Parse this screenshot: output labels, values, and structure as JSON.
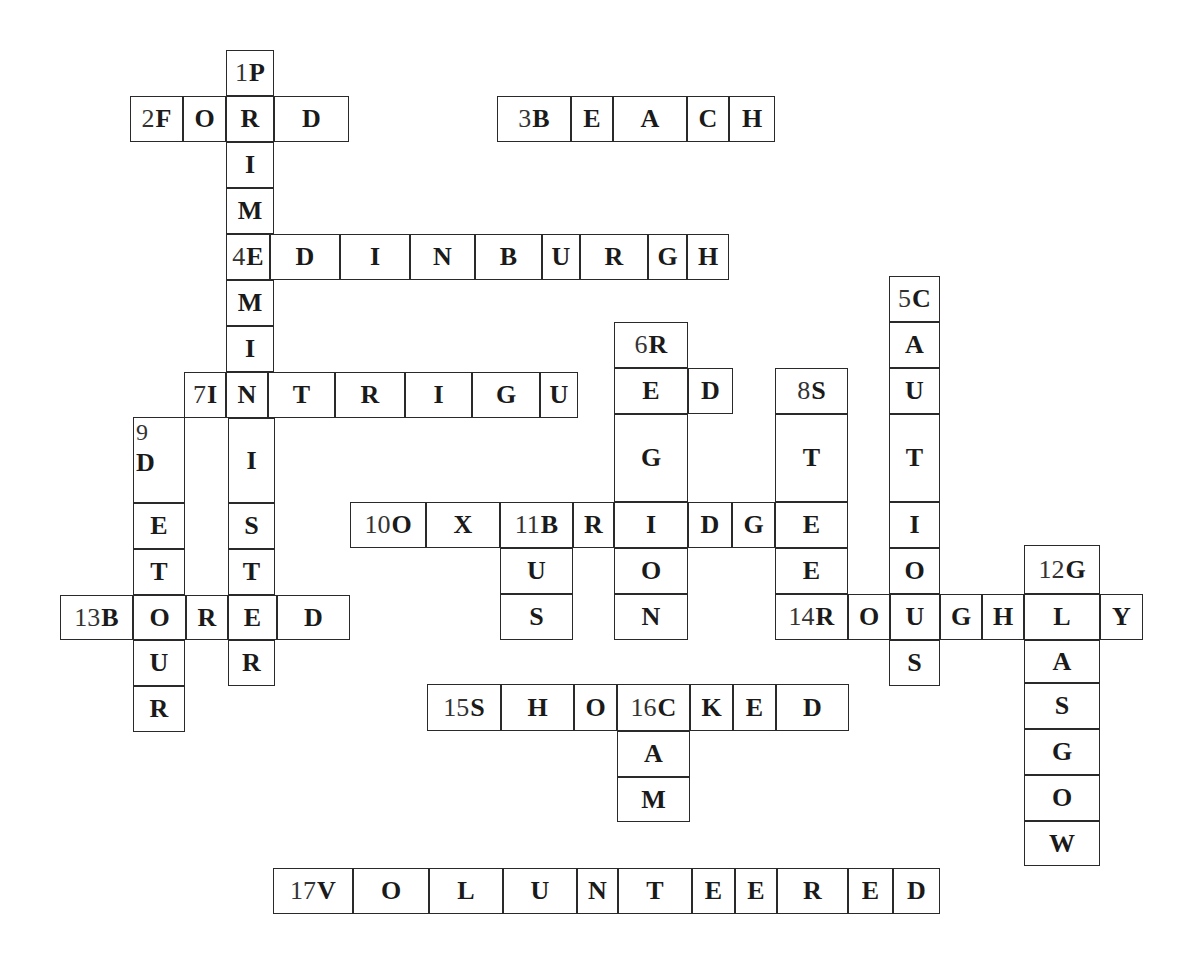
{
  "words": [
    {
      "number": "1",
      "direction": "down",
      "answer": "PRIMEMINISTER"
    },
    {
      "number": "2",
      "direction": "across",
      "answer": "FORD"
    },
    {
      "number": "3",
      "direction": "across",
      "answer": "BEACH"
    },
    {
      "number": "4",
      "direction": "across",
      "answer": "EDINBURGH"
    },
    {
      "number": "5",
      "direction": "down",
      "answer": "CAUTIOUS"
    },
    {
      "number": "6",
      "direction": "down",
      "answer": "REGION"
    },
    {
      "number": "7",
      "direction": "across",
      "answer": "INTRIGUED"
    },
    {
      "number": "8",
      "direction": "down",
      "answer": "STEEP"
    },
    {
      "number": "9",
      "direction": "down",
      "answer": "DETOUR"
    },
    {
      "number": "10",
      "direction": "across",
      "answer": "OXBRIDGE"
    },
    {
      "number": "11",
      "direction": "down",
      "answer": "BUS"
    },
    {
      "number": "12",
      "direction": "down",
      "answer": "GLASGOW"
    },
    {
      "number": "13",
      "direction": "across",
      "answer": "BORED"
    },
    {
      "number": "14",
      "direction": "across",
      "answer": "ROUGHLY"
    },
    {
      "number": "15",
      "direction": "across",
      "answer": "SHOCKED"
    },
    {
      "number": "16",
      "direction": "down",
      "answer": "CAM"
    },
    {
      "number": "17",
      "direction": "across",
      "answer": "VOLUNTEERED"
    }
  ],
  "cells": [
    {
      "x": 226,
      "y": 50,
      "w": 48,
      "h": 46,
      "num": "1",
      "l": "P"
    },
    {
      "x": 130,
      "y": 96,
      "w": 53,
      "h": 46,
      "num": "2",
      "l": "F"
    },
    {
      "x": 183,
      "y": 96,
      "w": 43,
      "h": 46,
      "l": "O"
    },
    {
      "x": 226,
      "y": 96,
      "w": 48,
      "h": 46,
      "l": "R"
    },
    {
      "x": 274,
      "y": 96,
      "w": 75,
      "h": 46,
      "l": "D"
    },
    {
      "x": 497,
      "y": 96,
      "w": 74,
      "h": 46,
      "num": "3",
      "l": "B"
    },
    {
      "x": 571,
      "y": 96,
      "w": 42,
      "h": 46,
      "l": "E"
    },
    {
      "x": 613,
      "y": 96,
      "w": 74,
      "h": 46,
      "l": "A"
    },
    {
      "x": 687,
      "y": 96,
      "w": 42,
      "h": 46,
      "l": "C"
    },
    {
      "x": 729,
      "y": 96,
      "w": 46,
      "h": 46,
      "l": "H"
    },
    {
      "x": 226,
      "y": 142,
      "w": 48,
      "h": 46,
      "l": "I"
    },
    {
      "x": 226,
      "y": 188,
      "w": 48,
      "h": 46,
      "l": "M"
    },
    {
      "x": 226,
      "y": 234,
      "w": 44,
      "h": 46,
      "num": "4",
      "l": "E"
    },
    {
      "x": 270,
      "y": 234,
      "w": 70,
      "h": 46,
      "l": "D"
    },
    {
      "x": 340,
      "y": 234,
      "w": 70,
      "h": 46,
      "l": "I"
    },
    {
      "x": 410,
      "y": 234,
      "w": 65,
      "h": 46,
      "l": "N"
    },
    {
      "x": 475,
      "y": 234,
      "w": 67,
      "h": 46,
      "l": "B"
    },
    {
      "x": 542,
      "y": 234,
      "w": 38,
      "h": 46,
      "l": "U"
    },
    {
      "x": 580,
      "y": 234,
      "w": 68,
      "h": 46,
      "l": "R"
    },
    {
      "x": 648,
      "y": 234,
      "w": 39,
      "h": 46,
      "l": "G"
    },
    {
      "x": 687,
      "y": 234,
      "w": 42,
      "h": 46,
      "l": "H"
    },
    {
      "x": 226,
      "y": 280,
      "w": 48,
      "h": 46,
      "l": "M"
    },
    {
      "x": 889,
      "y": 276,
      "w": 51,
      "h": 46,
      "num": "5",
      "l": "C"
    },
    {
      "x": 226,
      "y": 326,
      "w": 48,
      "h": 46,
      "l": "I"
    },
    {
      "x": 614,
      "y": 322,
      "w": 74,
      "h": 46,
      "num": "6",
      "l": "R"
    },
    {
      "x": 889,
      "y": 322,
      "w": 51,
      "h": 46,
      "l": "A"
    },
    {
      "x": 184,
      "y": 372,
      "w": 42,
      "h": 46,
      "num": "7",
      "l": "I"
    },
    {
      "x": 226,
      "y": 372,
      "w": 42,
      "h": 46,
      "l": "N"
    },
    {
      "x": 268,
      "y": 372,
      "w": 67,
      "h": 46,
      "l": "T"
    },
    {
      "x": 335,
      "y": 372,
      "w": 70,
      "h": 46,
      "l": "R"
    },
    {
      "x": 405,
      "y": 372,
      "w": 67,
      "h": 46,
      "l": "I"
    },
    {
      "x": 472,
      "y": 372,
      "w": 68,
      "h": 46,
      "l": "G"
    },
    {
      "x": 540,
      "y": 372,
      "w": 38,
      "h": 46,
      "l": "U"
    },
    {
      "x": 578,
      "y": 368,
      "w": 110,
      "h": 0,
      "l": ""
    },
    {
      "x": 614,
      "y": 368,
      "w": 74,
      "h": 46,
      "l": "E"
    },
    {
      "x": 688,
      "y": 368,
      "w": 45,
      "h": 46,
      "l": "D"
    },
    {
      "x": 775,
      "y": 368,
      "w": 73,
      "h": 46,
      "num": "8",
      "l": "S"
    },
    {
      "x": 889,
      "y": 368,
      "w": 51,
      "h": 46,
      "l": "U"
    },
    {
      "x": 133,
      "y": 417,
      "w": 52,
      "h": 86,
      "num": "9",
      "l": "D",
      "tall": true
    },
    {
      "x": 228,
      "y": 418,
      "w": 47,
      "h": 85,
      "l": "I"
    },
    {
      "x": 614,
      "y": 414,
      "w": 74,
      "h": 88,
      "l": "G"
    },
    {
      "x": 775,
      "y": 414,
      "w": 73,
      "h": 88,
      "l": "T"
    },
    {
      "x": 889,
      "y": 414,
      "w": 51,
      "h": 88,
      "l": "T"
    },
    {
      "x": 133,
      "y": 503,
      "w": 52,
      "h": 46,
      "l": "E"
    },
    {
      "x": 228,
      "y": 503,
      "w": 47,
      "h": 46,
      "l": "S"
    },
    {
      "x": 350,
      "y": 502,
      "w": 76,
      "h": 46,
      "num": "10",
      "l": "O"
    },
    {
      "x": 426,
      "y": 502,
      "w": 74,
      "h": 46,
      "l": "X"
    },
    {
      "x": 500,
      "y": 502,
      "w": 73,
      "h": 46,
      "num": "11",
      "l": "B"
    },
    {
      "x": 573,
      "y": 502,
      "w": 41,
      "h": 46,
      "l": "R"
    },
    {
      "x": 614,
      "y": 502,
      "w": 74,
      "h": 46,
      "l": "I"
    },
    {
      "x": 688,
      "y": 502,
      "w": 44,
      "h": 46,
      "l": "D"
    },
    {
      "x": 732,
      "y": 502,
      "w": 43,
      "h": 46,
      "l": "G"
    },
    {
      "x": 775,
      "y": 502,
      "w": 73,
      "h": 46,
      "l": "E"
    },
    {
      "x": 889,
      "y": 502,
      "w": 51,
      "h": 46,
      "l": "I"
    },
    {
      "x": 133,
      "y": 549,
      "w": 52,
      "h": 46,
      "l": "T"
    },
    {
      "x": 228,
      "y": 549,
      "w": 47,
      "h": 46,
      "l": "T"
    },
    {
      "x": 500,
      "y": 548,
      "w": 73,
      "h": 46,
      "l": "U"
    },
    {
      "x": 614,
      "y": 548,
      "w": 74,
      "h": 46,
      "l": "O"
    },
    {
      "x": 775,
      "y": 548,
      "w": 73,
      "h": 46,
      "l": "E"
    },
    {
      "x": 889,
      "y": 548,
      "w": 51,
      "h": 46,
      "l": "O"
    },
    {
      "x": 1024,
      "y": 545,
      "w": 76,
      "h": 49,
      "num": "12",
      "l": "G"
    },
    {
      "x": 60,
      "y": 595,
      "w": 73,
      "h": 45,
      "num": "13",
      "l": "B"
    },
    {
      "x": 133,
      "y": 595,
      "w": 53,
      "h": 45,
      "l": "O"
    },
    {
      "x": 186,
      "y": 595,
      "w": 42,
      "h": 45,
      "l": "R"
    },
    {
      "x": 228,
      "y": 595,
      "w": 49,
      "h": 45,
      "l": "E"
    },
    {
      "x": 277,
      "y": 595,
      "w": 73,
      "h": 45,
      "l": "D"
    },
    {
      "x": 500,
      "y": 594,
      "w": 73,
      "h": 46,
      "l": "S"
    },
    {
      "x": 614,
      "y": 594,
      "w": 74,
      "h": 46,
      "l": "N"
    },
    {
      "x": 775,
      "y": 594,
      "w": 73,
      "h": 46,
      "num": "14",
      "l": "R"
    },
    {
      "x": 848,
      "y": 594,
      "w": 42,
      "h": 46,
      "l": "O"
    },
    {
      "x": 890,
      "y": 594,
      "w": 50,
      "h": 46,
      "l": "U"
    },
    {
      "x": 940,
      "y": 594,
      "w": 42,
      "h": 46,
      "l": "G"
    },
    {
      "x": 982,
      "y": 594,
      "w": 42,
      "h": 46,
      "l": "H"
    },
    {
      "x": 1024,
      "y": 594,
      "w": 76,
      "h": 46,
      "l": "L"
    },
    {
      "x": 1100,
      "y": 594,
      "w": 43,
      "h": 46,
      "l": "Y"
    },
    {
      "x": 133,
      "y": 640,
      "w": 52,
      "h": 46,
      "l": "U"
    },
    {
      "x": 228,
      "y": 640,
      "w": 47,
      "h": 46,
      "l": "R"
    },
    {
      "x": 889,
      "y": 640,
      "w": 51,
      "h": 46,
      "l": "S"
    },
    {
      "x": 1024,
      "y": 640,
      "w": 76,
      "h": 43,
      "l": "A"
    },
    {
      "x": 133,
      "y": 686,
      "w": 52,
      "h": 46,
      "l": "R"
    },
    {
      "x": 427,
      "y": 684,
      "w": 74,
      "h": 47,
      "num": "15",
      "l": "S"
    },
    {
      "x": 501,
      "y": 684,
      "w": 73,
      "h": 47,
      "l": "H"
    },
    {
      "x": 574,
      "y": 684,
      "w": 43,
      "h": 47,
      "l": "O"
    },
    {
      "x": 617,
      "y": 684,
      "w": 73,
      "h": 47,
      "num": "16",
      "l": "C"
    },
    {
      "x": 690,
      "y": 684,
      "w": 43,
      "h": 47,
      "l": "K"
    },
    {
      "x": 733,
      "y": 684,
      "w": 43,
      "h": 47,
      "l": "E"
    },
    {
      "x": 776,
      "y": 684,
      "w": 73,
      "h": 47,
      "l": "D"
    },
    {
      "x": 1024,
      "y": 683,
      "w": 76,
      "h": 46,
      "l": "S"
    },
    {
      "x": 617,
      "y": 731,
      "w": 73,
      "h": 46,
      "l": "A"
    },
    {
      "x": 1024,
      "y": 729,
      "w": 76,
      "h": 46,
      "l": "G"
    },
    {
      "x": 617,
      "y": 777,
      "w": 73,
      "h": 45,
      "l": "M"
    },
    {
      "x": 1024,
      "y": 775,
      "w": 76,
      "h": 46,
      "l": "O"
    },
    {
      "x": 1024,
      "y": 821,
      "w": 76,
      "h": 45,
      "l": "W"
    },
    {
      "x": 273,
      "y": 868,
      "w": 80,
      "h": 46,
      "num": "17",
      "l": "V"
    },
    {
      "x": 353,
      "y": 868,
      "w": 76,
      "h": 46,
      "l": "O"
    },
    {
      "x": 429,
      "y": 868,
      "w": 74,
      "h": 46,
      "l": "L"
    },
    {
      "x": 503,
      "y": 868,
      "w": 74,
      "h": 46,
      "l": "U"
    },
    {
      "x": 577,
      "y": 868,
      "w": 41,
      "h": 46,
      "l": "N"
    },
    {
      "x": 618,
      "y": 868,
      "w": 74,
      "h": 46,
      "l": "T"
    },
    {
      "x": 692,
      "y": 868,
      "w": 43,
      "h": 46,
      "l": "E"
    },
    {
      "x": 735,
      "y": 868,
      "w": 42,
      "h": 46,
      "l": "E"
    },
    {
      "x": 777,
      "y": 868,
      "w": 71,
      "h": 46,
      "l": "R"
    },
    {
      "x": 848,
      "y": 868,
      "w": 45,
      "h": 46,
      "l": "E"
    },
    {
      "x": 893,
      "y": 868,
      "w": 47,
      "h": 46,
      "l": "D"
    }
  ]
}
